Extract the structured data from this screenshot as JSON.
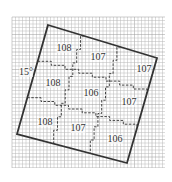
{
  "diagram": {
    "type": "grid-jigsaw-puzzle",
    "grid": {
      "x": 12,
      "y": 17,
      "width": 153,
      "height": 151,
      "cell": 3.5,
      "color": "#b8b8b8",
      "major_color": "#9a9a9a"
    },
    "outline": {
      "points": [
        [
          48,
          25
        ],
        [
          157,
          58
        ],
        [
          127,
          163
        ],
        [
          17,
          134
        ]
      ],
      "color": "#333333"
    },
    "angle_label": "15°",
    "regions": [
      {
        "label": "108",
        "x": 64,
        "y": 48
      },
      {
        "label": "107",
        "x": 98,
        "y": 57
      },
      {
        "label": "107",
        "x": 144,
        "y": 69
      },
      {
        "label": "108",
        "x": 53,
        "y": 83
      },
      {
        "label": "106",
        "x": 91,
        "y": 93
      },
      {
        "label": "107",
        "x": 129,
        "y": 102
      },
      {
        "label": "108",
        "x": 45,
        "y": 122
      },
      {
        "label": "107",
        "x": 78,
        "y": 128
      },
      {
        "label": "106",
        "x": 115,
        "y": 139
      }
    ]
  }
}
